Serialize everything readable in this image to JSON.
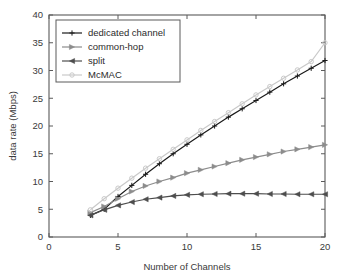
{
  "chart_data": {
    "type": "line",
    "title": "",
    "xlabel": "Number of Channels",
    "ylabel": "data rate (Mbps)",
    "xlim": [
      0,
      20
    ],
    "ylim": [
      0,
      40
    ],
    "xticks": [
      0,
      5,
      10,
      15,
      20
    ],
    "yticks": [
      0,
      5,
      10,
      15,
      20,
      25,
      30,
      35,
      40
    ],
    "grid": false,
    "legend_position": "upper-left",
    "x": [
      3,
      4,
      5,
      6,
      7,
      8,
      9,
      10,
      11,
      12,
      13,
      14,
      15,
      16,
      17,
      18,
      19,
      20
    ],
    "series": [
      {
        "name": "dedicated channel",
        "color": "#1a1a1a",
        "marker": "plus",
        "values": [
          3.9,
          5.0,
          7.3,
          9.3,
          11.3,
          13.2,
          15.0,
          16.7,
          18.4,
          20.0,
          21.6,
          23.1,
          24.6,
          26.1,
          27.6,
          29.0,
          30.4,
          31.8
        ]
      },
      {
        "name": "common-hop",
        "color": "#8c8c8c",
        "marker": "triangle-right",
        "values": [
          4.4,
          5.5,
          6.9,
          8.2,
          9.2,
          10.0,
          10.7,
          11.5,
          12.1,
          12.7,
          13.3,
          13.9,
          14.4,
          14.9,
          15.4,
          15.8,
          16.2,
          16.6
        ]
      },
      {
        "name": "split",
        "color": "#4d4d4d",
        "marker": "triangle-left",
        "values": [
          3.9,
          4.9,
          5.7,
          6.3,
          6.8,
          7.1,
          7.4,
          7.6,
          7.7,
          7.75,
          7.8,
          7.8,
          7.8,
          7.75,
          7.75,
          7.7,
          7.7,
          7.7
        ]
      },
      {
        "name": "McMAC",
        "color": "#c9c9c9",
        "marker": "circle",
        "values": [
          4.9,
          6.9,
          8.8,
          10.6,
          12.4,
          14.1,
          15.8,
          17.5,
          19.2,
          20.8,
          22.4,
          24.0,
          25.6,
          27.1,
          28.6,
          30.1,
          31.6,
          35.0
        ]
      }
    ]
  },
  "axes": {
    "xlabel": "Number of Channels",
    "ylabel": "data rate (Mbps)",
    "xtick_labels": [
      "0",
      "5",
      "10",
      "15",
      "20"
    ],
    "ytick_labels": [
      "0",
      "5",
      "10",
      "15",
      "20",
      "25",
      "30",
      "35",
      "40"
    ]
  },
  "legend": {
    "items": [
      {
        "label": "dedicated channel"
      },
      {
        "label": "common-hop"
      },
      {
        "label": "split"
      },
      {
        "label": "McMAC"
      }
    ]
  },
  "colors": {
    "axis": "#4a4a4a",
    "background": "#ffffff"
  }
}
